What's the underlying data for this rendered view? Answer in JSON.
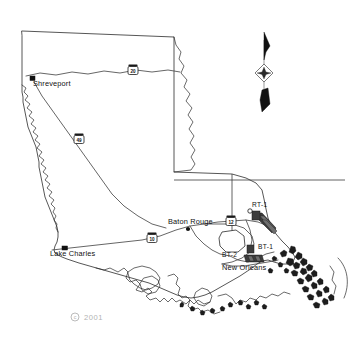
{
  "map": {
    "title": "Louisiana study area map",
    "copyright": {
      "symbol": "c",
      "year": "2001"
    },
    "cities": [
      {
        "name": "Shreveport",
        "marker": "square",
        "x": 33,
        "y": 79
      },
      {
        "name": "Baton Rouge",
        "marker": "dot",
        "x": 172,
        "y": 222
      },
      {
        "name": "Lake Charles",
        "marker": "square",
        "x": 50,
        "y": 250
      },
      {
        "name": "New Orleans",
        "marker": "none",
        "x": 222,
        "y": 267
      }
    ],
    "highway_shields": [
      {
        "route": "20",
        "x": 133,
        "y": 70
      },
      {
        "route": "49",
        "x": 79,
        "y": 139
      },
      {
        "route": "10",
        "x": 152,
        "y": 238
      },
      {
        "route": "12",
        "x": 231,
        "y": 221
      }
    ],
    "site_labels": [
      {
        "id": "RT-1",
        "x": 252,
        "y": 207
      },
      {
        "id": "BT-1",
        "x": 257,
        "y": 249
      },
      {
        "id": "BT-2",
        "x": 226,
        "y": 257
      }
    ],
    "compass": {
      "name": "north-arrow",
      "x": 264,
      "y": 73
    },
    "colors": {
      "outline": "#2b2b2b",
      "highway": "#4a4a4a",
      "marsh": "#1d1d1d",
      "transect": "#3c3c3c",
      "copyright": "#b3b3b3",
      "background": "#ffffff"
    }
  }
}
